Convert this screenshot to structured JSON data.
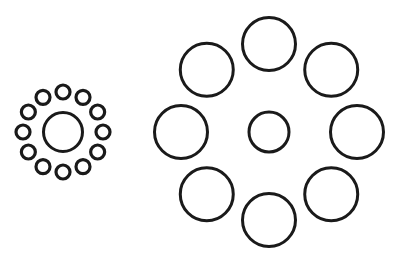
{
  "diagram": {
    "name": "Ebbinghaus illusion",
    "stroke_color": "#1a1a1a",
    "background": "#ffffff",
    "left_group": {
      "center": [
        63,
        132
      ],
      "center_radius": 19.5,
      "center_stroke": 3,
      "surround_count": 12,
      "surround_ring_radius": 40,
      "surround_radius": 7,
      "surround_stroke": 3.2
    },
    "right_group": {
      "center": [
        269,
        132
      ],
      "center_radius": 20,
      "center_stroke": 3,
      "surround_count": 8,
      "surround_ring_radius": 88,
      "surround_radius": 26.5,
      "surround_stroke": 3
    }
  }
}
